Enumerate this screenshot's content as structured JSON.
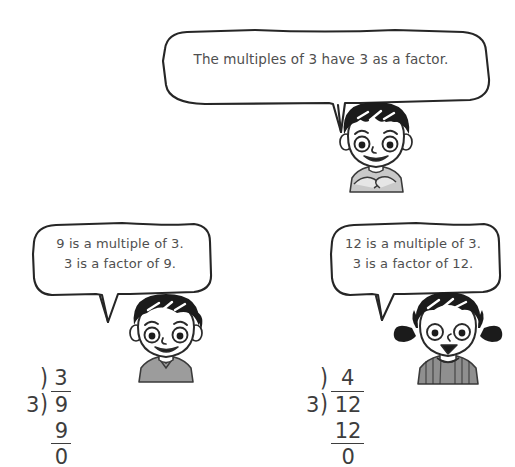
{
  "page": {
    "background_color": "#ffffff",
    "ink_color": "#3d3d3d",
    "text_color": "#4f4f4f"
  },
  "bubbles": {
    "top": {
      "text": "The multiples of 3 have 3 as a factor.",
      "speaker": "boy-spiky-hair"
    },
    "left": {
      "line1": "9 is a multiple of 3.",
      "line2": "3 is a factor of 9.",
      "text": "9 is a multiple of 3.\n3 is a factor of 9.",
      "speaker": "boy-dark-hair"
    },
    "right": {
      "line1": "12 is a multiple of 3.",
      "line2": "3 is a factor of 12.",
      "text": "12 is a multiple of 3.\n3 is a factor of 12.",
      "speaker": "girl-pigtails"
    }
  },
  "characters": {
    "top": {
      "name": "boy-spiky-hair",
      "hair_color": "#1b1b1b",
      "shirt_color": "#c9c9c9"
    },
    "left": {
      "name": "boy-dark-hair",
      "hair_color": "#1b1b1b",
      "shirt_color": "#9c9c9c"
    },
    "right": {
      "name": "girl-pigtails",
      "hair_color": "#1b1b1b",
      "shirt_color": "#8f8f8f"
    }
  },
  "divisions": {
    "left": {
      "quotient": "3",
      "divisor": "3",
      "bracket": ")",
      "dividend": "9",
      "subtrahend": "9",
      "remainder": "0"
    },
    "right": {
      "quotient": "4",
      "divisor": "3",
      "bracket": ")",
      "dividend": "12",
      "subtrahend": "12",
      "remainder": "0"
    }
  }
}
